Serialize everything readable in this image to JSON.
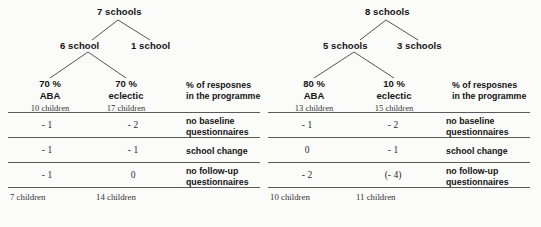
{
  "figure": {
    "panels": [
      {
        "id": "left",
        "tree": {
          "root": "7 schools",
          "level2_left": "6 school",
          "level2_right": "1 school"
        },
        "leaves": [
          {
            "pct": "70 %",
            "kind": "ABA",
            "count": "10 children"
          },
          {
            "pct": "70 %",
            "kind": "eclectic",
            "count": "17 children"
          }
        ],
        "legend": {
          "line1": "% of resposnes",
          "line2": "in the programme"
        },
        "table": {
          "rows": [
            {
              "col1": "- 1",
              "col2": "- 2",
              "label_line1": "no baseline",
              "label_line2": "questionnaires"
            },
            {
              "col1": "- 1",
              "col2": "- 1",
              "label_line1": "school change",
              "label_line2": ""
            },
            {
              "col1": "- 1",
              "col2": "0",
              "label_line1": "no follow-up",
              "label_line2": "questionnaires"
            }
          ],
          "totals": {
            "col1": "7 children",
            "col2": "14 children"
          }
        }
      },
      {
        "id": "right",
        "tree": {
          "root": "8 schools",
          "level2_left": "5 schools",
          "level2_right": "3 schools"
        },
        "leaves": [
          {
            "pct": "80 %",
            "kind": "ABA",
            "count": "13 children"
          },
          {
            "pct": "10 %",
            "kind": "eclectic",
            "count": "15  children"
          }
        ],
        "legend": {
          "line1": "% of resposnes",
          "line2": "in the programme"
        },
        "table": {
          "rows": [
            {
              "col1": "- 1",
              "col2": "- 2",
              "label_line1": "no baseline",
              "label_line2": "questionnaires"
            },
            {
              "col1": "0",
              "col2": "- 1",
              "label_line1": "school change",
              "label_line2": ""
            },
            {
              "col1": "- 2",
              "col2": "(- 4)",
              "label_line1": "no follow-up",
              "label_line2": "questionnaires"
            }
          ],
          "totals": {
            "col1": "10 children",
            "col2": "11 children"
          }
        }
      }
    ],
    "colors": {
      "background": "#fbfbfa",
      "text": "#141414",
      "rule": "#5a5a5a",
      "connector": "#555555"
    }
  }
}
